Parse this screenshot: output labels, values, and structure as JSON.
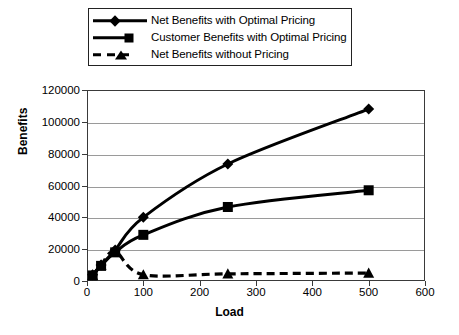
{
  "chart_data": {
    "type": "line",
    "title": "",
    "xlabel": "Load",
    "ylabel": "Benefits",
    "xlim": [
      0,
      600
    ],
    "ylim": [
      0,
      120000
    ],
    "xticks": [
      0,
      100,
      200,
      300,
      400,
      500,
      600
    ],
    "yticks": [
      0,
      20000,
      40000,
      60000,
      80000,
      100000,
      120000
    ],
    "grid": true,
    "legend_position": "top",
    "x": [
      10,
      25,
      50,
      100,
      250,
      500
    ],
    "series": [
      {
        "name": "Net Benefits with Optimal Pricing",
        "marker": "diamond",
        "linestyle": "solid",
        "color": "#000000",
        "values": [
          4000,
          10000,
          19500,
          40000,
          73500,
          108000
        ]
      },
      {
        "name": "Customer Benefits with Optimal Pricing",
        "marker": "square",
        "linestyle": "solid",
        "color": "#000000",
        "values": [
          3500,
          9500,
          18000,
          29000,
          46500,
          57000
        ]
      },
      {
        "name": "Net Benefits without Pricing",
        "marker": "triangle",
        "linestyle": "dashed",
        "color": "#000000",
        "values": [
          3500,
          10000,
          18500,
          4000,
          4500,
          5000
        ]
      }
    ]
  },
  "legend": {
    "entries": [
      {
        "label": "Net Benefits with Optimal Pricing"
      },
      {
        "label": "Customer Benefits with Optimal Pricing"
      },
      {
        "label": "Net Benefits without Pricing"
      }
    ]
  },
  "axes": {
    "x_title": "Load",
    "y_title": "Benefits",
    "x_tick_labels": [
      "0",
      "100",
      "200",
      "300",
      "400",
      "500",
      "600"
    ],
    "y_tick_labels": [
      "0",
      "20000",
      "40000",
      "60000",
      "80000",
      "100000",
      "120000"
    ]
  }
}
